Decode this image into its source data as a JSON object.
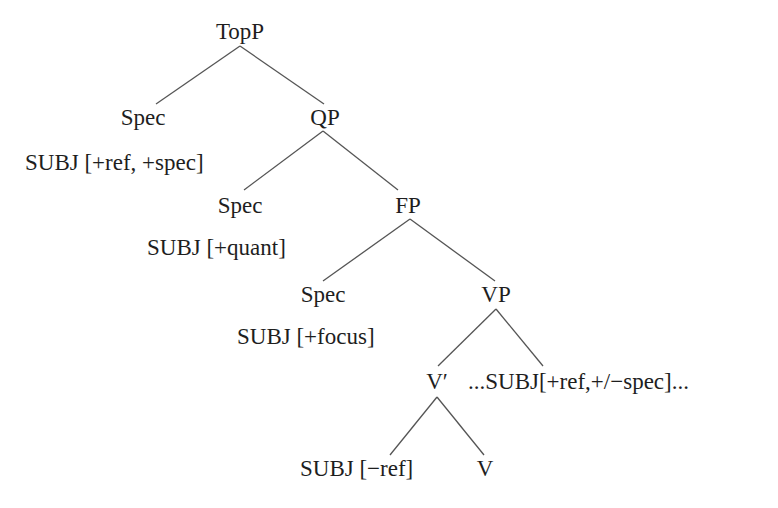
{
  "tree": {
    "nodes": [
      {
        "id": "topp",
        "label": "TopP"
      },
      {
        "id": "spec1",
        "label": "Spec"
      },
      {
        "id": "qp",
        "label": "QP"
      },
      {
        "id": "spec1_content",
        "label": "SUBJ [+ref, +spec]"
      },
      {
        "id": "spec2",
        "label": "Spec"
      },
      {
        "id": "fp",
        "label": "FP"
      },
      {
        "id": "spec2_content",
        "label": "SUBJ [+quant]"
      },
      {
        "id": "spec3",
        "label": "Spec"
      },
      {
        "id": "vp",
        "label": "VP"
      },
      {
        "id": "spec3_content",
        "label": "SUBJ [+focus]"
      },
      {
        "id": "vbar",
        "label": "V′"
      },
      {
        "id": "vp_complement",
        "label": "...SUBJ[+ref,+/−spec]..."
      },
      {
        "id": "subj_noref",
        "label": "SUBJ [−ref]"
      },
      {
        "id": "v",
        "label": "V"
      }
    ],
    "edges": [
      [
        "topp",
        "spec1"
      ],
      [
        "topp",
        "qp"
      ],
      [
        "qp",
        "spec2"
      ],
      [
        "qp",
        "fp"
      ],
      [
        "fp",
        "spec3"
      ],
      [
        "fp",
        "vp"
      ],
      [
        "vp",
        "vbar"
      ],
      [
        "vp",
        "vp_complement"
      ],
      [
        "vbar",
        "subj_noref"
      ],
      [
        "vbar",
        "v"
      ]
    ]
  },
  "labels": {
    "topp": "TopP",
    "spec1": "Spec",
    "qp": "QP",
    "spec1_content": "SUBJ [+ref, +spec]",
    "spec2": "Spec",
    "fp": "FP",
    "spec2_content": "SUBJ [+quant]",
    "spec3": "Spec",
    "vp": "VP",
    "spec3_content": "SUBJ [+focus]",
    "vbar": "V′",
    "vp_complement": "...SUBJ[+ref,+/−spec]...",
    "subj_noref": "SUBJ [−ref]",
    "v": "V"
  }
}
